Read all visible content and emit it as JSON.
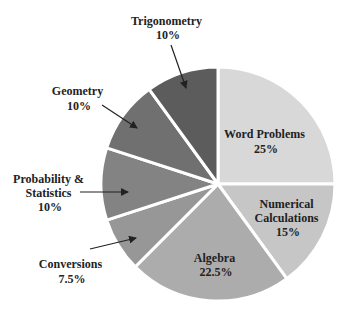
{
  "chart_data": {
    "type": "pie",
    "title": "",
    "start_angle_deg": 0,
    "direction": "clockwise",
    "center": [
      218,
      184
    ],
    "radius": 117,
    "slices": [
      {
        "label": "Word Problems",
        "value": 25,
        "pct_label": "25%",
        "color": "#d8d8d8"
      },
      {
        "label": "Numerical Calculations",
        "value": 15,
        "pct_label": "15%",
        "color": "#c6c6c6"
      },
      {
        "label": "Algebra",
        "value": 22.5,
        "pct_label": "22.5%",
        "color": "#acacac"
      },
      {
        "label": "Conversions",
        "value": 7.5,
        "pct_label": "7.5%",
        "color": "#979797"
      },
      {
        "label": "Probability & Statistics",
        "value": 10,
        "pct_label": "10%",
        "color": "#838383"
      },
      {
        "label": "Geometry",
        "value": 10,
        "pct_label": "10%",
        "color": "#707070"
      },
      {
        "label": "Trigonometry",
        "value": 10,
        "pct_label": "10%",
        "color": "#5c5c5c"
      }
    ]
  },
  "labels": {
    "word_problems": {
      "line1": "Word Problems",
      "pct": "25%"
    },
    "numerical": {
      "line1": "Numerical",
      "line2": "Calculations",
      "pct": "15%"
    },
    "algebra": {
      "line1": "Algebra",
      "pct": "22.5%"
    },
    "conversions": {
      "line1": "Conversions",
      "pct": "7.5%"
    },
    "probability": {
      "line1": "Probability &",
      "line2": "Statistics",
      "pct": "10%"
    },
    "geometry": {
      "line1": "Geometry",
      "pct": "10%"
    },
    "trigonometry": {
      "line1": "Trigonometry",
      "pct": "10%"
    }
  }
}
